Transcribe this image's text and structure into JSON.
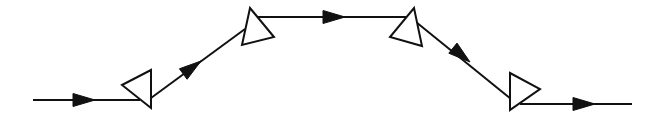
{
  "diagram": {
    "colors": {
      "line": "#111111",
      "background": "#ffffff",
      "prism_fill": "#ffffff"
    },
    "beams": [
      {
        "id": "input-beam",
        "from": [
          33,
          100
        ],
        "to": [
          140,
          100
        ],
        "arrow_at": [
          95,
          100
        ],
        "direction": "right"
      },
      {
        "id": "beam-prism1-to-prism2",
        "from": [
          151,
          98
        ],
        "to": [
          245,
          29
        ],
        "arrow_at": [
          201,
          61
        ],
        "direction": "up-right"
      },
      {
        "id": "beam-prism2-to-prism3",
        "from": [
          256,
          17
        ],
        "to": [
          410,
          17
        ],
        "arrow_at": [
          345,
          17
        ],
        "direction": "right"
      },
      {
        "id": "beam-prism3-to-prism4",
        "from": [
          416,
          22
        ],
        "to": [
          511,
          99
        ],
        "arrow_at": [
          470,
          62
        ],
        "direction": "down-right"
      },
      {
        "id": "output-beam",
        "from": [
          520,
          104
        ],
        "to": [
          632,
          104
        ],
        "arrow_at": [
          595,
          104
        ],
        "direction": "right"
      }
    ],
    "prisms": [
      {
        "id": "prism-1",
        "points": [
          [
            122,
            85
          ],
          [
            151,
            70
          ],
          [
            151,
            108
          ]
        ]
      },
      {
        "id": "prism-2",
        "points": [
          [
            250,
            8
          ],
          [
            274,
            37
          ],
          [
            242,
            45
          ]
        ]
      },
      {
        "id": "prism-3",
        "points": [
          [
            414,
            8
          ],
          [
            422,
            46
          ],
          [
            390,
            37
          ]
        ]
      },
      {
        "id": "prism-4",
        "points": [
          [
            510,
            73
          ],
          [
            540,
            89
          ],
          [
            510,
            110
          ]
        ]
      }
    ]
  }
}
